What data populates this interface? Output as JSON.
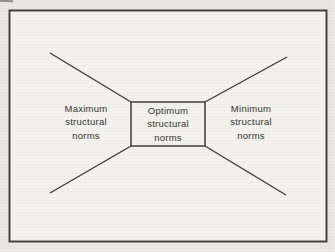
{
  "figure": {
    "left_label": {
      "line1": "Maximum",
      "line2": "structural",
      "line3": "norms"
    },
    "center_box": {
      "line1": "Optimum",
      "line2": "structural",
      "line3": "norms"
    },
    "right_label": {
      "line1": "Minimum",
      "line2": "structural",
      "line3": "norms"
    }
  },
  "colors": {
    "line": "#3c3b38",
    "text": "#34332f",
    "paper_inside_frame": "#f3f2ed",
    "paper_margin": "#eae8e3"
  }
}
